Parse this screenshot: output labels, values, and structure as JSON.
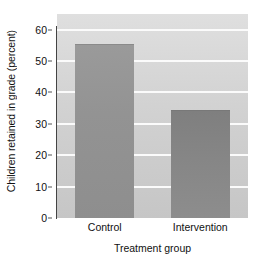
{
  "chart_data": {
    "type": "bar",
    "title": "",
    "categories": [
      "Control",
      "Intervention"
    ],
    "values": [
      55,
      34
    ],
    "xlabel": "Treatment group",
    "ylabel": "Children retained in grade (percent)",
    "ylim": [
      0,
      65
    ],
    "yticks": [
      0,
      10,
      20,
      30,
      40,
      50,
      60
    ],
    "ytick_labels": [
      "0",
      "10",
      "20",
      "30",
      "40",
      "50",
      "60"
    ],
    "grid": "horizontal",
    "legend": "none",
    "colors": {
      "plot_background": "#d4d4d4",
      "gridline": "#fbfbfb",
      "bar_control": "#949494",
      "bar_intervention": "#868686",
      "axis": "#444444",
      "text": "#111111"
    }
  }
}
